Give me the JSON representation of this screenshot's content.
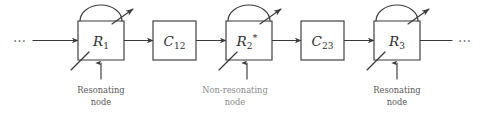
{
  "diagram": {
    "background_color": "#ffffff",
    "line_color": "#3a3a3a",
    "caption_color": "#5a5a5a",
    "caption_faded_color": "#8c8c8c",
    "left_ellipsis": "⋯",
    "right_ellipsis": "⋯",
    "resonator_nodes": [
      {
        "id": "R1",
        "label_base": "R",
        "label_sub": "1",
        "label_star": "",
        "caption_line1": "Resonating",
        "caption_line2": "node",
        "caption_style": "normal"
      },
      {
        "id": "R2",
        "label_base": "R",
        "label_sub": "2",
        "label_star": "*",
        "caption_line1": "Non-resonating",
        "caption_line2": "node",
        "caption_style": "faded"
      },
      {
        "id": "R3",
        "label_base": "R",
        "label_sub": "3",
        "label_star": "",
        "caption_line1": "Resonating",
        "caption_line2": "node",
        "caption_style": "normal"
      }
    ],
    "coupler_nodes": [
      {
        "id": "C12",
        "label_base": "C",
        "label_sub": "12"
      },
      {
        "id": "C23",
        "label_base": "C",
        "label_sub": "23"
      }
    ]
  }
}
